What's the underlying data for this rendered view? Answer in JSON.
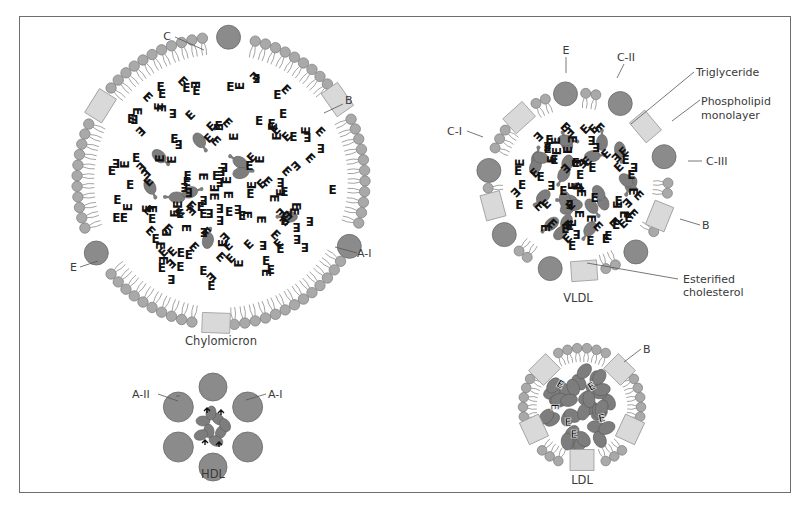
{
  "colors": {
    "frame": "#6e6e6e",
    "phospholipid_head": "#a9a9a9",
    "phospholipid_outline": "#7a7a7a",
    "apoprotein": "#8b8b8b",
    "apoprotein_outline": "#6a6a6a",
    "apo_b_block": "#d9d9d9",
    "apo_b_outline": "#9a9a9a",
    "tail": "#7c7c7c",
    "cholesterol_ester": "#7d7d7d",
    "triglyceride_glyph": "#111111",
    "label_text": "#3a3a3a"
  },
  "particles": [
    {
      "id": "chylomicron",
      "title": "Chylomicron",
      "labels": [
        {
          "text": "C",
          "role": "apoprotein"
        },
        {
          "text": "B",
          "role": "apoprotein"
        },
        {
          "text": "A-I",
          "role": "apoprotein"
        },
        {
          "text": "E",
          "role": "apoprotein"
        }
      ]
    },
    {
      "id": "vldl",
      "title": "VLDL",
      "labels": [
        {
          "text": "E",
          "role": "apoprotein"
        },
        {
          "text": "C-II",
          "role": "apoprotein"
        },
        {
          "text": "Triglyceride",
          "role": "core-lipid"
        },
        {
          "text": "Phospholipid",
          "role": "shell"
        },
        {
          "text": "monolayer",
          "role": "shell"
        },
        {
          "text": "C-I",
          "role": "apoprotein"
        },
        {
          "text": "C-III",
          "role": "apoprotein"
        },
        {
          "text": "B",
          "role": "apoprotein"
        },
        {
          "text": "Esterified",
          "role": "core-lipid"
        },
        {
          "text": "cholesterol",
          "role": "core-lipid"
        }
      ]
    },
    {
      "id": "hdl",
      "title": "HDL",
      "labels": [
        {
          "text": "A-II",
          "role": "apoprotein"
        },
        {
          "text": "A-I",
          "role": "apoprotein"
        }
      ]
    },
    {
      "id": "ldl",
      "title": "LDL",
      "labels": [
        {
          "text": "B",
          "role": "apoprotein"
        }
      ]
    }
  ],
  "glyphs": {
    "triglyceride": "E"
  }
}
